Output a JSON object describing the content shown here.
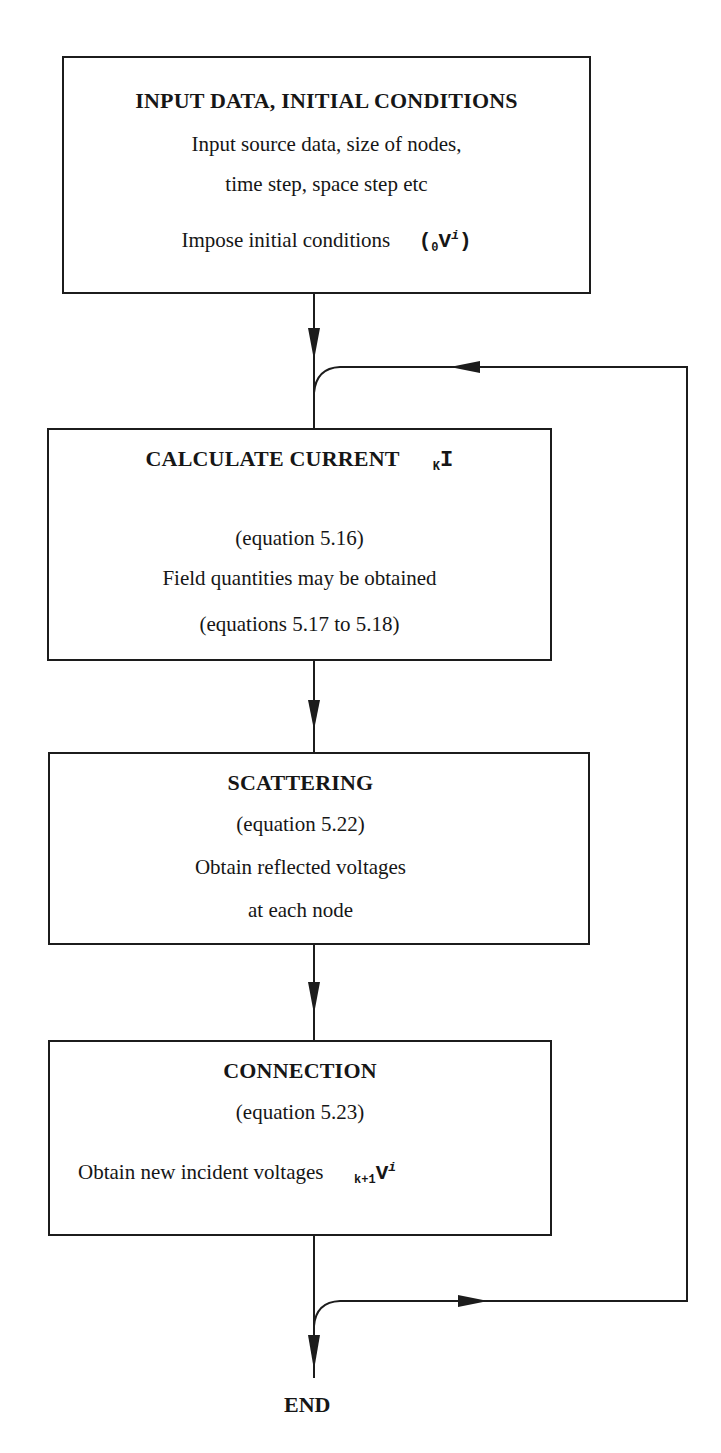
{
  "diagram": {
    "type": "flowchart",
    "boxes": [
      {
        "id": "input",
        "title": "INPUT DATA, INITIAL CONDITIONS",
        "lines": [
          "Input source data, size of nodes,",
          "time step, space step etc",
          "Impose initial conditions"
        ],
        "symbol": {
          "open": "(",
          "sub": "0",
          "main": "V",
          "sup": "i",
          "close": ")"
        }
      },
      {
        "id": "calculate-current",
        "title": "CALCULATE CURRENT",
        "title_symbol": {
          "sub": "K",
          "main": "I"
        },
        "lines": [
          "(equation 5.16)",
          "Field quantities may be obtained",
          "(equations 5.17 to 5.18)"
        ]
      },
      {
        "id": "scattering",
        "title": "SCATTERING",
        "lines": [
          "(equation 5.22)",
          "Obtain reflected voltages",
          "at each node"
        ]
      },
      {
        "id": "connection",
        "title": "CONNECTION",
        "lines": [
          "(equation 5.23)",
          "Obtain new incident voltages"
        ],
        "symbol": {
          "sub": "k+1",
          "main": "V",
          "sup": "i"
        }
      }
    ],
    "end_label": "END",
    "edges": [
      {
        "from": "input",
        "to": "calculate-current"
      },
      {
        "from": "calculate-current",
        "to": "scattering"
      },
      {
        "from": "scattering",
        "to": "connection"
      },
      {
        "from": "connection",
        "to": "calculate-current",
        "kind": "loop-back"
      },
      {
        "from": "connection",
        "to": "end"
      }
    ],
    "colors": {
      "line": "#1c1c1c",
      "background": "#ffffff",
      "text": "#161616"
    }
  }
}
